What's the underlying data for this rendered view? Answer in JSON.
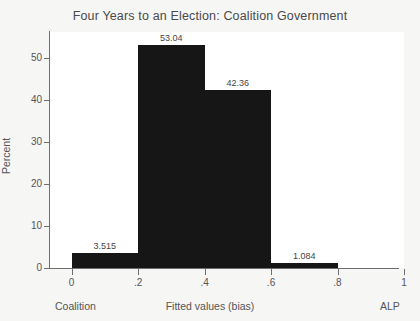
{
  "chart_data": {
    "type": "bar",
    "title": "Four Years to an Election: Coalition Government",
    "xlabel": "Fitted values (bias)",
    "ylabel": "Percent",
    "grid": false,
    "legend": "none",
    "bar_style": "histogram-adjacent-black",
    "xlim": [
      -0.065,
      1.0
    ],
    "ylim": [
      0,
      55.5
    ],
    "xticks": [
      "0",
      ".2",
      ".4",
      ".6",
      ".8",
      "1"
    ],
    "xtick_values": [
      0,
      0.2,
      0.4,
      0.6,
      0.8,
      1
    ],
    "yticks": [
      "0",
      "10",
      "20",
      "30",
      "40",
      "50"
    ],
    "ytick_values": [
      0,
      10,
      20,
      30,
      40,
      50
    ],
    "x_left_endpoint_label": "Coalition",
    "x_right_endpoint_label": "ALP",
    "bin_edges": [
      0.0,
      0.2,
      0.4,
      0.6,
      0.8
    ],
    "categories": [
      "0 - .2",
      ".2 - .4",
      ".4 - .6",
      ".6 - .8"
    ],
    "values": [
      3.515,
      53.04,
      42.36,
      1.084
    ],
    "data_labels": [
      "3.515",
      "53.04",
      "42.36",
      "1.084"
    ],
    "colors": {
      "bar": "#161616",
      "plot_background": "#ffffff",
      "figure_background": "#f6f6f5",
      "axis": "#6e6e6e",
      "text": "#555555",
      "title_text": "#4a4a4a"
    }
  }
}
